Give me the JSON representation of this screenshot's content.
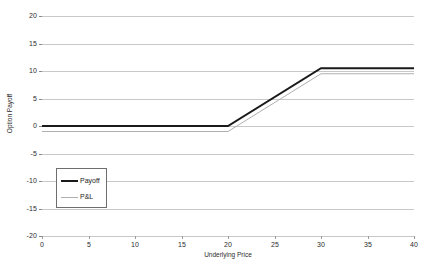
{
  "chart_data": {
    "type": "line",
    "title": "",
    "subtitle": "",
    "xlabel": "Underlying Price",
    "ylabel": "Option Payoff",
    "xlim": [
      0,
      40
    ],
    "ylim": [
      -20,
      20
    ],
    "xticks": [
      0,
      5,
      10,
      15,
      20,
      25,
      30,
      35,
      40
    ],
    "yticks": [
      20,
      15,
      10,
      5,
      0,
      -5,
      -10,
      -15,
      -20
    ],
    "xticklabels": [
      "0",
      "5",
      "10",
      "15",
      "20",
      "25",
      "30",
      "35",
      "40"
    ],
    "yticklabels": [
      "20",
      "15",
      "10",
      "5",
      "0",
      "-5",
      "-10",
      "-15",
      "-20"
    ],
    "grid": "horizontal",
    "grid_color": "#c8c8c8",
    "legend_position": "inside-lower-left",
    "x": [
      0,
      20,
      30,
      40
    ],
    "series": [
      {
        "name": "Payoff",
        "values": [
          0,
          0,
          10.5,
          10.5
        ],
        "color": "#1a1a1a",
        "width": 2
      },
      {
        "name": "P&L",
        "values": [
          -1,
          -1,
          9.5,
          9.5
        ],
        "color": "#b0b0b0",
        "width": 1
      }
    ]
  },
  "legend": {
    "items": [
      {
        "label": "Payoff"
      },
      {
        "label": "P&L"
      }
    ]
  },
  "axes": {
    "y_title": "Option Payoff",
    "x_title": "Underlying Price"
  },
  "colors": {
    "background": "#ffffff",
    "gridline": "#c8c8c8",
    "axis": "#8a8a8a",
    "payoff": "#1a1a1a",
    "pnl": "#b0b0b0",
    "legend_border": "#6e6e6e",
    "text": "#2b2b2b"
  }
}
